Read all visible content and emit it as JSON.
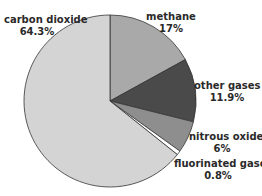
{
  "chart_data": {
    "type": "pie",
    "title": "",
    "slices": [
      {
        "label": "carbon dioxide",
        "value": 64.3,
        "value_label": "64.3%",
        "color": "#d4d4d4"
      },
      {
        "label": "methane",
        "value": 17,
        "value_label": "17%",
        "color": "#a9a9a9"
      },
      {
        "label": "other gases",
        "value": 11.9,
        "value_label": "11.9%",
        "color": "#4a4a4a"
      },
      {
        "label": "nitrous oxide",
        "value": 6,
        "value_label": "6%",
        "color": "#8e8e8e"
      },
      {
        "label": "fluorinated gases",
        "value": 0.8,
        "value_label": "0.8%",
        "color": "#ffffff"
      }
    ],
    "start_angle": "12 o'clock",
    "direction": "clockwise (methane first)",
    "legend": "none (direct labels)"
  }
}
